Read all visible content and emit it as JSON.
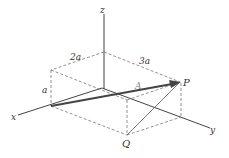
{
  "diagram": {
    "axes": {
      "x_label": "x",
      "y_label": "y",
      "z_label": "z"
    },
    "points": {
      "P_label": "P",
      "Q_label": "Q"
    },
    "vector_label": "A",
    "dimensions": {
      "height_label": "a",
      "x_extent_label": "2a",
      "y_extent_label": "3a"
    },
    "colors": {
      "axis": "#444444",
      "dashed": "#777777",
      "vector": "#444444"
    }
  }
}
